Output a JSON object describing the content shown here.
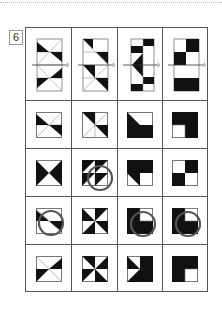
{
  "problem": {
    "number": "6"
  },
  "grid": {
    "columns": 4,
    "rows": 5,
    "header_row": "folded-paper-figures",
    "answer_rows": 4,
    "marked_answers": [
      {
        "row": 2,
        "col": 2,
        "mark": "circle"
      },
      {
        "row": 3,
        "col": 1,
        "mark": "circle"
      },
      {
        "row": 3,
        "col": 3,
        "mark": "circle"
      },
      {
        "row": 3,
        "col": 4,
        "mark": "circle"
      }
    ]
  },
  "colors": {
    "fill": "#111111",
    "line": "#555555",
    "circle": "#555555"
  }
}
